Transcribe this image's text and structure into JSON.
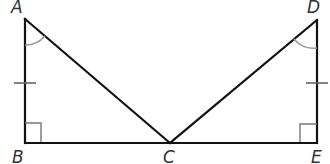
{
  "diagram": {
    "points": {
      "A": {
        "label": "A",
        "x": 25,
        "y": 19
      },
      "B": {
        "label": "B",
        "x": 25,
        "y": 143
      },
      "C": {
        "label": "C",
        "x": 170,
        "y": 143
      },
      "D": {
        "label": "D",
        "x": 317,
        "y": 20
      },
      "E": {
        "label": "E",
        "x": 317,
        "y": 143
      }
    },
    "segments": [
      "AB",
      "BC",
      "AC",
      "CD",
      "DE",
      "CE"
    ],
    "markings": {
      "congruent_sides": [
        "AB",
        "DE"
      ],
      "right_angles": [
        "B",
        "E"
      ],
      "congruent_angles": [
        "A",
        "D"
      ]
    },
    "colors": {
      "line": "#111111",
      "arc": "#999999",
      "tick": "#555555",
      "label": "#333333"
    }
  }
}
